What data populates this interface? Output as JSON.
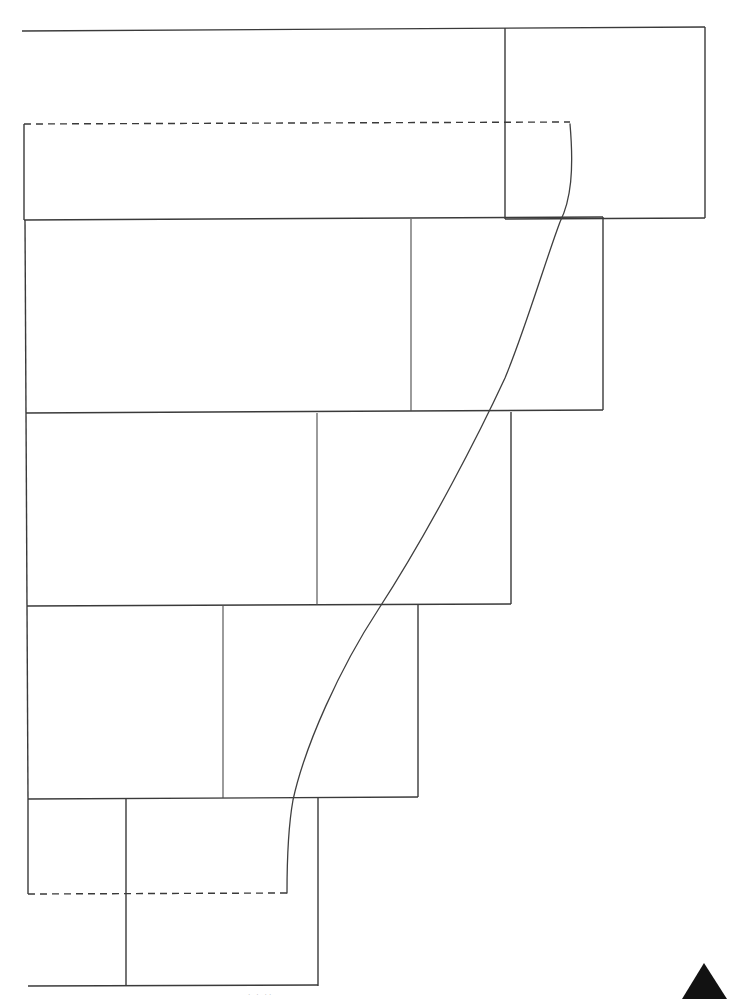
{
  "page": {
    "title": "Scanned line drawing",
    "width": 731,
    "height": 999,
    "background_color": "#ffffff",
    "line_color": "#3a3a3a",
    "mark_color": "#121212"
  },
  "figure": {
    "description": "Nested stepped rectangular frames with a crossing curve",
    "top_rule_label": "top horizontal rule",
    "curve_label": "crossing curve",
    "dashed_top_label": "upper dashed guide",
    "dashed_bottom_label": "lower dashed guide",
    "corner_mark_label": "corner triangle mark"
  },
  "bands": [
    {
      "name": "band-1",
      "label": "Band 1",
      "x": 24,
      "y": 124,
      "width": 482,
      "height": 96
    },
    {
      "name": "band-2",
      "label": "Band 2",
      "x": 25,
      "y": 220,
      "width": 578,
      "height": 193
    },
    {
      "name": "band-3",
      "label": "Band 3",
      "x": 26,
      "y": 413,
      "width": 485,
      "height": 192
    },
    {
      "name": "band-4",
      "label": "Band 4",
      "x": 27,
      "y": 605,
      "width": 391,
      "height": 193
    },
    {
      "name": "band-5",
      "label": "Band 5",
      "x": 28,
      "y": 798,
      "width": 290,
      "height": 95
    },
    {
      "name": "band-6",
      "label": "Band 6",
      "x": 126,
      "y": 893,
      "width": 192,
      "height": 93
    }
  ],
  "panels": [
    {
      "name": "panel-top-right",
      "label": "Top right panel",
      "x": 505,
      "y": 28,
      "width": 200,
      "height": 191
    },
    {
      "name": "panel-band2-right",
      "label": "Band 2 right panel",
      "divider_x": 411
    },
    {
      "name": "panel-band3-right",
      "label": "Band 3 right panel",
      "divider_x": 317
    },
    {
      "name": "panel-band4-right",
      "label": "Band 4 right panel",
      "divider_x": 223
    },
    {
      "name": "panel-band5-right",
      "label": "Band 5 right panel",
      "divider_x": 126
    }
  ],
  "rules": {
    "top_rule": {
      "x1": 22,
      "y1": 31,
      "x2": 705,
      "y2": 27
    },
    "bottom_rule": {
      "x1": 28,
      "y1": 986,
      "x2": 318,
      "y2": 985
    }
  },
  "dashed_guides": {
    "top": {
      "x1": 24,
      "y1": 124,
      "x2": 570,
      "y2": 122
    },
    "bottom": {
      "x1": 28,
      "y1": 894,
      "x2": 287,
      "y2": 893
    }
  },
  "curve": {
    "start": {
      "x": 570,
      "y": 124
    },
    "end": {
      "x": 287,
      "y": 893
    },
    "control_points": [
      {
        "x": 572,
        "y": 215
      },
      {
        "x": 520,
        "y": 350
      },
      {
        "x": 487,
        "y": 415
      },
      {
        "x": 378,
        "y": 610
      },
      {
        "x": 300,
        "y": 800
      }
    ]
  },
  "corner_mark": {
    "label": "corner triangle",
    "apex": {
      "x": 704,
      "y": 963
    },
    "left": {
      "x": 682,
      "y": 999
    },
    "right": {
      "x": 727,
      "y": 999
    }
  },
  "footer": {
    "faint_marks": "· · ··"
  }
}
